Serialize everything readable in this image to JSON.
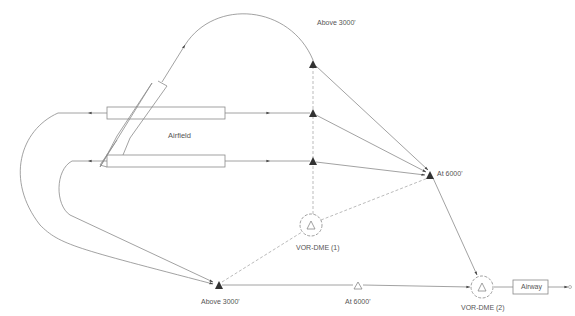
{
  "diagram": {
    "type": "approach-procedure-diagram",
    "labels": {
      "airfield": "Airfield",
      "top_fix": "Above 3000'",
      "at6000_fix": "At 6000'",
      "bottom_fix": "Above 3000'",
      "mid_fix": "At 6000'",
      "vor1": "VOR-DME (1)",
      "vor2": "VOR-DME (2)",
      "airway": "Airway"
    },
    "colors": {
      "line": "#8a8a8a",
      "fix": "#333333",
      "text": "#555555"
    }
  }
}
